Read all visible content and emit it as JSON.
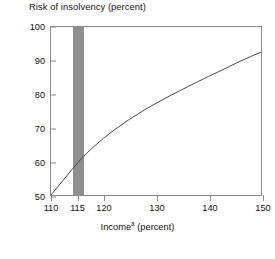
{
  "chart_data": {
    "type": "line",
    "title": "Risk of insolvency (percent)",
    "xlabel": "Income",
    "xlabel_superscript": "a",
    "xlabel_suffix": " (percent)",
    "ylabel": "Risk of insolvency (percent)",
    "xlim": [
      110,
      150
    ],
    "ylim": [
      50,
      100
    ],
    "grid": false,
    "legend": false,
    "x_ticks": [
      110,
      115,
      120,
      130,
      140,
      150
    ],
    "x_tick_labels": [
      "110",
      "115",
      "120",
      "130",
      "140",
      "150"
    ],
    "y_ticks": [
      50,
      60,
      70,
      80,
      90,
      100
    ],
    "y_tick_labels": [
      "50",
      "60",
      "70",
      "80",
      "90",
      "100"
    ],
    "series": [
      {
        "name": "Risk of insolvency",
        "color": "#4a4a4a",
        "x": [
          110,
          112,
          114,
          115,
          116,
          118,
          120,
          122,
          125,
          128,
          130,
          133,
          136,
          140,
          143,
          146,
          148,
          150
        ],
        "y": [
          50.0,
          53.8,
          57.6,
          59.4,
          61.2,
          64.2,
          66.9,
          69.3,
          72.6,
          75.5,
          77.3,
          79.8,
          82.2,
          85.3,
          87.5,
          89.8,
          91.2,
          92.5
        ]
      }
    ],
    "shaded_band": {
      "name": "highlight-band",
      "x_start": 114.1,
      "x_end": 116.3,
      "color": "#8f8f8f"
    }
  },
  "footnote_strip": ""
}
